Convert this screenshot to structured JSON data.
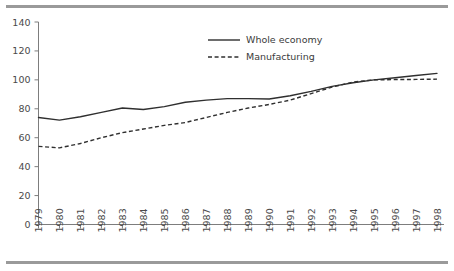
{
  "chart_data": {
    "type": "line",
    "title": "",
    "subtitle": "",
    "xlabel": "",
    "ylabel": "",
    "categories": [
      "1979",
      "1980",
      "1981",
      "1982",
      "1983",
      "1984",
      "1985",
      "1986",
      "1987",
      "1988",
      "1989",
      "1990",
      "1991",
      "1992",
      "1993",
      "1994",
      "1995",
      "1996",
      "1997",
      "1998"
    ],
    "series": [
      {
        "name": "Whole economy",
        "style": "solid",
        "color": "#2f2f2f",
        "values": [
          74.0,
          72.2,
          74.5,
          77.5,
          80.5,
          79.5,
          81.5,
          84.5,
          86.0,
          87.0,
          87.0,
          86.8,
          89.0,
          92.0,
          95.5,
          98.0,
          100.0,
          101.5,
          103.0,
          104.5
        ]
      },
      {
        "name": "Manufacturing",
        "style": "dashed",
        "color": "#2f2f2f",
        "values": [
          54.0,
          53.0,
          56.0,
          60.0,
          63.5,
          66.0,
          68.5,
          70.5,
          74.0,
          77.5,
          80.5,
          83.0,
          86.0,
          90.5,
          95.0,
          98.5,
          100.0,
          100.2,
          100.3,
          100.5
        ]
      }
    ],
    "ylim": [
      0,
      140
    ],
    "yticks": [
      0,
      20,
      40,
      60,
      80,
      100,
      120,
      140
    ],
    "xlim": [
      "1979",
      "1998"
    ],
    "grid": false,
    "legend_position": "top-center",
    "legend_entries": [
      "Whole economy",
      "Manufacturing"
    ]
  },
  "figure": {
    "top_rule_color": "#9a9a9a",
    "bottom_rule_color": "#9a9a9a",
    "background": "#ffffff"
  }
}
